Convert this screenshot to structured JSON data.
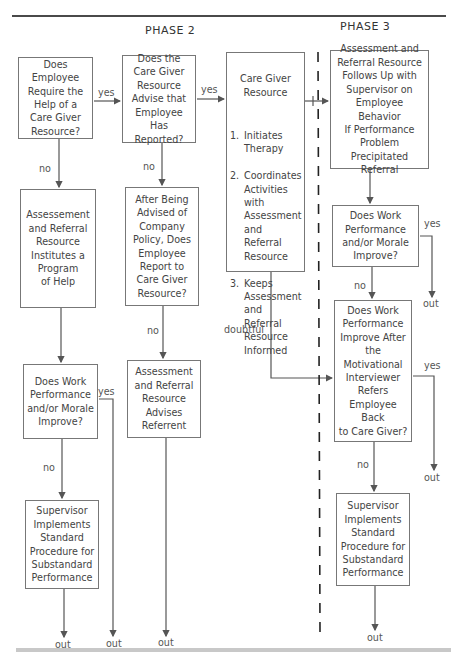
{
  "headers": {
    "phase2": "PHASE 2",
    "phase3": "PHASE 3"
  },
  "boxes": {
    "require_help": "Does Employee\nRequire the\nHelp of a\nCare Giver\nResource?",
    "care_giver_advise": "Does the\nCare Giver\nResource\nAdvise that\nEmployee Has\nReported?",
    "care_giver_resource": {
      "title": "Care Giver\nResource",
      "items": [
        {
          "num": "1.",
          "text": "Initiates Therapy"
        },
        {
          "num": "2.",
          "text": "Coordinates Activities with Assessment and Referral Resource"
        },
        {
          "num": "3.",
          "text": "Keeps Assessment and Referral Resource Informed"
        }
      ]
    },
    "follows_up": "Assessment and\nReferral Resource\nFollows Up with\nSupervisor on\nEmployee Behavior\nIf Performance\nProblem Precipitated\nReferral",
    "institutes_program": "Assessement\nand Referral\nResource\nInstitutes a\nProgram\nof Help",
    "after_advised": "After Being\nAdvised of\nCompany\nPolicy, Does\nEmployee\nReport to\nCare Giver\nResource?",
    "work_improve_p3": "Does Work\nPerformance\nand/or Morale\nImprove?",
    "work_improve_p2": "Does Work\nPerformance\nand/or Morale\nImprove?",
    "advises_referrent": "Assessment\nand Referral\nResource\nAdvises\nReferrent",
    "motivational": "Does Work\nPerformance\nImprove After\nthe\nMotivational\nInterviewer\nRefers\nEmployee Back\nto Care Giver?",
    "supervisor_p2": "Supervisor\nImplements\nStandard\nProcedure for\nSubstandard\nPerformance",
    "supervisor_p3": "Supervisor\nImplements\nStandard\nProcedure for\nSubstandard\nPerformance"
  },
  "labels": {
    "yes1": "yes",
    "yes2": "yes",
    "no1": "no",
    "no2": "no",
    "no3": "no",
    "no4": "no",
    "no5": "no",
    "yes3": "yes",
    "yes4": "yes",
    "yes5": "yes",
    "doubtful": "doubtful",
    "out1": "out",
    "out2": "out",
    "out3": "out",
    "out4": "out",
    "out5": "out",
    "out6": "out"
  }
}
